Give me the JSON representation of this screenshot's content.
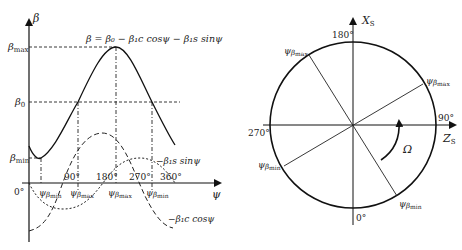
{
  "left_plot": {
    "y_axis_label": "β",
    "x_axis_label": "ψ",
    "equation": "β = β₀ − β₁c cosψ − β₁s sinψ",
    "y_ticks": {
      "max": "β",
      "max_sub": "max",
      "zero": "β",
      "zero_sub": "0",
      "min": "β",
      "min_sub": "min"
    },
    "x_ticks": [
      "0°",
      "90°",
      "180°",
      "270°",
      "360°"
    ],
    "markers": [
      {
        "sym": "ψ",
        "sub": "β",
        "subsub": "min"
      },
      {
        "sym": "ψ",
        "sub": "β̇",
        "subsub": "max"
      },
      {
        "sym": "ψ",
        "sub": "β",
        "subsub": "max"
      },
      {
        "sym": "ψ",
        "sub": "β̇",
        "subsub": "min"
      }
    ],
    "curve_labels": {
      "sin": "−β₁s sinψ",
      "cos": "−β₁c cosψ"
    }
  },
  "right_plot": {
    "vertical_axis": "X",
    "vertical_axis_sub": "S",
    "horizontal_axis": "Z",
    "horizontal_axis_sub": "S",
    "angles": {
      "top": "180°",
      "right": "90°",
      "bottom": "0°",
      "left": "270°"
    },
    "rotation_label": "Ω",
    "radial_labels": [
      {
        "sym": "ψ",
        "sub": "β",
        "subsub": "max"
      },
      {
        "sym": "ψ",
        "sub": "β̇",
        "subsub": "max"
      },
      {
        "sym": "ψ",
        "sub": "β̇",
        "subsub": "min"
      },
      {
        "sym": "ψ",
        "sub": "β",
        "subsub": "min"
      }
    ]
  }
}
